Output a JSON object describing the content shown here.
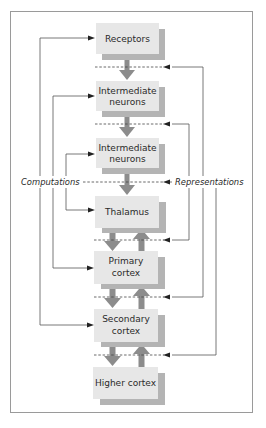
{
  "diagram": {
    "type": "hierarchical sensory processing flow",
    "colors": {
      "box_fill": "#e7e7e7",
      "box_shadow": "#b4b4b4",
      "thick_arrow": "#8c8c8c",
      "line": "#555555",
      "frame": "#9a9a9a"
    },
    "labels": {
      "left": "Computations",
      "right": "Representations"
    },
    "nodes": [
      {
        "id": "receptors",
        "lines": [
          "Receptors"
        ]
      },
      {
        "id": "intermediate1",
        "lines": [
          "Intermediate",
          "neurons"
        ]
      },
      {
        "id": "intermediate2",
        "lines": [
          "Intermediate",
          "neurons"
        ]
      },
      {
        "id": "thalamus",
        "lines": [
          "Thalamus"
        ]
      },
      {
        "id": "primary",
        "lines": [
          "Primary",
          "cortex"
        ]
      },
      {
        "id": "secondary",
        "lines": [
          "Secondary",
          "cortex"
        ]
      },
      {
        "id": "higher",
        "lines": [
          "Higher cortex"
        ]
      }
    ],
    "edges": [
      {
        "from": "receptors",
        "to": "intermediate1",
        "kind": "feedforward"
      },
      {
        "from": "intermediate1",
        "to": "intermediate2",
        "kind": "feedforward"
      },
      {
        "from": "intermediate2",
        "to": "thalamus",
        "kind": "feedforward"
      },
      {
        "from": "thalamus",
        "to": "primary",
        "kind": "feedforward"
      },
      {
        "from": "primary",
        "to": "thalamus",
        "kind": "feedback"
      },
      {
        "from": "primary",
        "to": "secondary",
        "kind": "feedforward"
      },
      {
        "from": "secondary",
        "to": "primary",
        "kind": "feedback"
      },
      {
        "from": "secondary",
        "to": "higher",
        "kind": "feedforward"
      },
      {
        "from": "higher",
        "to": "secondary",
        "kind": "feedback"
      }
    ]
  }
}
